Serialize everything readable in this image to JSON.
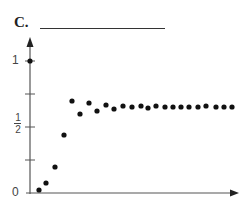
{
  "panel_label": "C.",
  "axis": {
    "y_tick_labels": [
      "1",
      "1",
      "2",
      "0"
    ],
    "label_one": "1",
    "label_half_num": "1",
    "label_half_den": "2",
    "label_zero": "0"
  },
  "chart_data": {
    "type": "scatter",
    "title": "C.",
    "xlabel": "",
    "ylabel": "",
    "ylim": [
      0,
      1.1
    ],
    "y_ticks": [
      0,
      0.25,
      0.5,
      0.75,
      1
    ],
    "y_tick_labels": [
      "0",
      "",
      "1/2",
      "",
      "1"
    ],
    "x": [
      0,
      1,
      2,
      3,
      4,
      5,
      6,
      7,
      8,
      9,
      10,
      11,
      12,
      13,
      14,
      15,
      16,
      17,
      18,
      19,
      20,
      21,
      22,
      23,
      24,
      25
    ],
    "values": [
      1.0,
      0.02,
      0.08,
      0.2,
      0.44,
      0.7,
      0.6,
      0.68,
      0.62,
      0.67,
      0.64,
      0.66,
      0.65,
      0.66,
      0.65,
      0.66,
      0.65,
      0.66,
      0.66,
      0.66,
      0.65,
      0.66,
      0.66,
      0.67,
      0.66,
      0.66
    ],
    "points_px": [
      [
        30,
        61
      ],
      [
        39,
        190
      ],
      [
        46,
        183
      ],
      [
        55,
        167
      ],
      [
        64,
        135
      ],
      [
        72,
        101
      ],
      [
        80,
        114
      ],
      [
        89,
        103
      ],
      [
        97,
        111
      ],
      [
        106,
        105
      ],
      [
        114,
        109
      ],
      [
        123,
        106
      ],
      [
        132,
        107
      ],
      [
        141,
        106
      ],
      [
        148,
        108
      ],
      [
        156,
        106
      ],
      [
        165,
        107
      ],
      [
        173,
        107
      ],
      [
        181,
        107
      ],
      [
        189,
        107
      ],
      [
        198,
        107
      ],
      [
        206,
        106
      ],
      [
        216,
        107
      ],
      [
        224,
        107
      ],
      [
        232,
        107
      ]
    ],
    "grid": false,
    "legend": null
  }
}
